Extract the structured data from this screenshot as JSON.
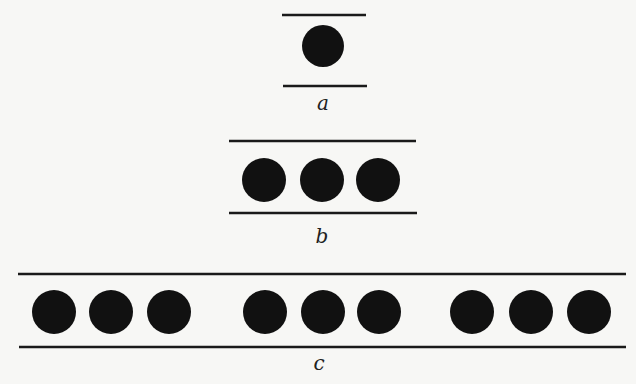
{
  "diagram": {
    "panels": [
      {
        "id": "a",
        "label": "a",
        "top_line": {
          "x1": 282,
          "x2": 366,
          "y": 15
        },
        "bottom_line": {
          "x1": 283,
          "x2": 367,
          "y": 86
        },
        "circle_y": 46,
        "radius": 21,
        "circles_x": [
          323
        ],
        "label_pos": {
          "x": 323,
          "y": 110
        }
      },
      {
        "id": "b",
        "label": "b",
        "top_line": {
          "x1": 229,
          "x2": 416,
          "y": 141
        },
        "bottom_line": {
          "x1": 229,
          "x2": 417,
          "y": 213
        },
        "circle_y": 180,
        "radius": 22,
        "circles_x": [
          264,
          322,
          378
        ],
        "label_pos": {
          "x": 322,
          "y": 243
        }
      },
      {
        "id": "c",
        "label": "c",
        "top_line": {
          "x1": 18,
          "x2": 626,
          "y": 274
        },
        "bottom_line": {
          "x1": 19,
          "x2": 626,
          "y": 347
        },
        "circle_y": 312,
        "radius": 22,
        "circles_x": [
          54,
          111,
          169,
          265,
          323,
          379,
          472,
          531,
          589
        ],
        "label_pos": {
          "x": 319,
          "y": 370
        }
      }
    ],
    "colors": {
      "ink": "#111111",
      "background": "#f7f7f5"
    }
  }
}
